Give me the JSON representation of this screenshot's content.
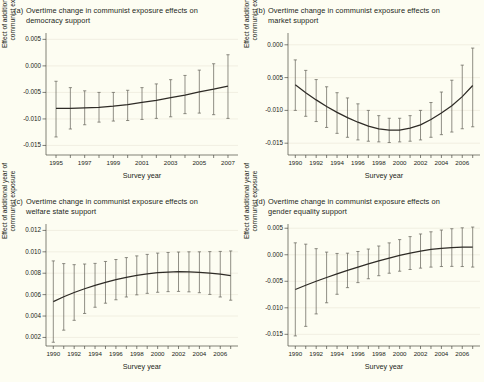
{
  "figure": {
    "background_color": "#fdfdf2",
    "line_color": "#2e2b26",
    "errorbar_color": "#6b6a60",
    "grid_color": "#eceadb",
    "axis_color": "#4a4a44",
    "layout": "2x2 grid of panels"
  },
  "shared": {
    "xlabel": "Survey year",
    "ylabel_line1": "Effect of additional year of",
    "ylabel_line2": "communist exposure"
  },
  "chart_data": [
    {
      "type": "line",
      "panel": "a",
      "tag": "(a)",
      "title": "Overtime change in communist exposure effects on democracy support",
      "title_line1": "Overtime change in communist exposure effects on",
      "title_line2": "democracy support",
      "xlabel": "Survey year",
      "ylabel": "Effect of additional year of communist exposure",
      "xlim": [
        1994.3,
        2007.7
      ],
      "ylim": [
        -0.0168,
        0.0062
      ],
      "yticks": [
        0.005,
        0.0,
        -0.005,
        -0.01,
        -0.015
      ],
      "ytick_labels": [
        "0.005",
        "0.000",
        "-0.005",
        "-0.010",
        "-0.015"
      ],
      "xticks": [
        1995,
        1997,
        1999,
        2001,
        2003,
        2005,
        2007
      ],
      "xtick_labels": [
        "1995",
        "1997",
        "1999",
        "2001",
        "2003",
        "2005",
        "2007"
      ],
      "x_minor_ticks": [
        1995,
        1996,
        1997,
        1998,
        1999,
        2000,
        2001,
        2002,
        2003,
        2004,
        2005,
        2006,
        2007
      ],
      "grid": true,
      "x": [
        1995,
        1996,
        1997,
        1998,
        1999,
        2000,
        2001,
        2002,
        2003,
        2004,
        2005,
        2006,
        2007
      ],
      "values": [
        -0.008,
        -0.008,
        -0.0079,
        -0.0078,
        -0.0076,
        -0.0073,
        -0.0069,
        -0.0065,
        -0.006,
        -0.0055,
        -0.0049,
        -0.0044,
        -0.0038
      ],
      "ci_low": [
        -0.0134,
        -0.0119,
        -0.0111,
        -0.0106,
        -0.0104,
        -0.0103,
        -0.0101,
        -0.0099,
        -0.0096,
        -0.009,
        -0.0089,
        -0.0092,
        -0.0099
      ],
      "ci_high": [
        -0.0029,
        -0.0041,
        -0.0047,
        -0.005,
        -0.005,
        -0.0046,
        -0.0041,
        -0.0034,
        -0.0026,
        -0.0018,
        -0.0008,
        0.0004,
        0.0021
      ]
    },
    {
      "type": "line",
      "panel": "b",
      "tag": "(b)",
      "title": "Overtime change in communist exposure effects on market support",
      "title_line1": "Overtime change in communist exposure effects on",
      "title_line2": "market support",
      "xlabel": "Survey year",
      "ylabel": "Effect of additional year of communist exposure",
      "xlim": [
        1989.3,
        2007.7
      ],
      "ylim": [
        -0.0168,
        0.0018
      ],
      "yticks": [
        0.0,
        -0.005,
        -0.01,
        -0.015
      ],
      "ytick_labels": [
        "0.000",
        "0.005",
        "-0.010",
        "-0.015"
      ],
      "xticks": [
        1990,
        1992,
        1994,
        1996,
        1998,
        2000,
        2002,
        2004,
        2006
      ],
      "xtick_labels": [
        "1990",
        "1992",
        "1994",
        "1996",
        "1998",
        "2000",
        "2002",
        "2004",
        "2006"
      ],
      "x_minor_ticks": [
        1990,
        1991,
        1992,
        1993,
        1994,
        1995,
        1996,
        1997,
        1998,
        1999,
        2000,
        2001,
        2002,
        2003,
        2004,
        2005,
        2006,
        2007
      ],
      "grid": true,
      "x": [
        1990,
        1991,
        1992,
        1993,
        1994,
        1995,
        1996,
        1997,
        1998,
        1999,
        2000,
        2001,
        2002,
        2003,
        2004,
        2005,
        2006,
        2007
      ],
      "values": [
        -0.0061,
        -0.0073,
        -0.0084,
        -0.0094,
        -0.0103,
        -0.0111,
        -0.0118,
        -0.0124,
        -0.0128,
        -0.013,
        -0.013,
        -0.0127,
        -0.0122,
        -0.0114,
        -0.0104,
        -0.0093,
        -0.0079,
        -0.0062
      ],
      "ci_low": [
        -0.01,
        -0.0109,
        -0.0117,
        -0.0126,
        -0.0135,
        -0.0141,
        -0.0145,
        -0.0147,
        -0.0148,
        -0.0149,
        -0.0148,
        -0.0147,
        -0.0145,
        -0.0141,
        -0.0137,
        -0.0133,
        -0.0128,
        -0.0125
      ],
      "ci_high": [
        -0.0023,
        -0.0039,
        -0.0053,
        -0.0064,
        -0.0073,
        -0.0081,
        -0.009,
        -0.01,
        -0.0108,
        -0.0112,
        -0.0112,
        -0.0108,
        -0.01,
        -0.0088,
        -0.0072,
        -0.0054,
        -0.0031,
        -0.0005
      ]
    },
    {
      "type": "line",
      "panel": "c",
      "tag": "(c)",
      "title": "Overtime change in communist exposure effects on welfare state support",
      "title_line1": "Overtime change in communist exposure effects on",
      "title_line2": "welfare state support",
      "xlabel": "Survey year",
      "ylabel": "Effect of additional year of communist exposure",
      "xlim": [
        1989.3,
        2007.7
      ],
      "ylim": [
        0.0012,
        0.0126
      ],
      "yticks": [
        0.012,
        0.01,
        0.008,
        0.006,
        0.004,
        0.002
      ],
      "ytick_labels": [
        "0.012",
        "0.010",
        "0.008",
        "0.006",
        "0.004",
        "0.002"
      ],
      "xticks": [
        1990,
        1992,
        1994,
        1996,
        1998,
        2000,
        2002,
        2004,
        2006
      ],
      "xtick_labels": [
        "1990",
        "1992",
        "1994",
        "1996",
        "1998",
        "2000",
        "2002",
        "2004",
        "2006"
      ],
      "x_minor_ticks": [
        1990,
        1991,
        1992,
        1993,
        1994,
        1995,
        1996,
        1997,
        1998,
        1999,
        2000,
        2001,
        2002,
        2003,
        2004,
        2005,
        2006,
        2007
      ],
      "grid": true,
      "x": [
        1990,
        1991,
        1992,
        1993,
        1994,
        1995,
        1996,
        1997,
        1998,
        1999,
        2000,
        2001,
        2002,
        2003,
        2004,
        2005,
        2006,
        2007
      ],
      "values": [
        0.00535,
        0.0058,
        0.0062,
        0.00655,
        0.00687,
        0.00715,
        0.0074,
        0.00762,
        0.0078,
        0.00794,
        0.00805,
        0.00811,
        0.00814,
        0.00813,
        0.00809,
        0.00802,
        0.00791,
        0.00778
      ],
      "ci_low": [
        0.00155,
        0.00268,
        0.0036,
        0.00424,
        0.00482,
        0.0052,
        0.00552,
        0.00578,
        0.00598,
        0.00612,
        0.00622,
        0.00628,
        0.0063,
        0.00626,
        0.00618,
        0.00602,
        0.00578,
        0.00548
      ],
      "ci_high": [
        0.00915,
        0.0089,
        0.0088,
        0.00886,
        0.00892,
        0.0091,
        0.00928,
        0.00946,
        0.00962,
        0.00976,
        0.00988,
        0.00994,
        0.00998,
        0.01,
        0.01,
        0.01002,
        0.01004,
        0.01008
      ]
    },
    {
      "type": "line",
      "panel": "d",
      "tag": "(d)",
      "title": "Overtime change in communist exposure effects on gender equality support",
      "title_line1": "Overtime change in communist exposure effects on",
      "title_line2": "gender equality support",
      "xlabel": "Survey year",
      "ylabel": "Effect of additional year of communist exposure",
      "xlim": [
        1989.3,
        2007.7
      ],
      "ylim": [
        -0.0172,
        0.0058
      ],
      "yticks": [
        0.005,
        0.0,
        -0.005,
        -0.01,
        -0.015
      ],
      "ytick_labels": [
        "0.005",
        "0.000",
        "-0.005",
        "-0.010",
        "-0.015"
      ],
      "xticks": [
        1990,
        1992,
        1994,
        1996,
        1998,
        2000,
        2002,
        2004,
        2006
      ],
      "xtick_labels": [
        "1990",
        "1992",
        "1994",
        "1996",
        "1998",
        "2000",
        "2002",
        "2004",
        "2006"
      ],
      "x_minor_ticks": [
        1990,
        1991,
        1992,
        1993,
        1994,
        1995,
        1996,
        1997,
        1998,
        1999,
        2000,
        2001,
        2002,
        2003,
        2004,
        2005,
        2006,
        2007
      ],
      "grid": true,
      "x": [
        1990,
        1991,
        1992,
        1993,
        1994,
        1995,
        1996,
        1997,
        1998,
        1999,
        2000,
        2001,
        2002,
        2003,
        2004,
        2005,
        2006,
        2007
      ],
      "values": [
        -0.00655,
        -0.00575,
        -0.005,
        -0.00428,
        -0.0036,
        -0.00295,
        -0.00232,
        -0.00172,
        -0.00115,
        -0.00062,
        -0.00012,
        0.00032,
        0.0007,
        0.001,
        0.00122,
        0.00136,
        0.00143,
        0.00145
      ],
      "ci_low": [
        -0.0153,
        -0.0135,
        -0.01115,
        -0.00905,
        -0.00745,
        -0.0062,
        -0.00525,
        -0.00452,
        -0.00395,
        -0.00348,
        -0.0031,
        -0.00278,
        -0.00252,
        -0.00233,
        -0.00222,
        -0.00219,
        -0.00222,
        -0.00232
      ],
      "ci_high": [
        0.00225,
        0.002,
        0.00115,
        0.0005,
        0.00025,
        0.0003,
        0.00062,
        0.00108,
        0.00165,
        0.00224,
        0.00286,
        0.00342,
        0.00392,
        0.00433,
        0.00466,
        0.00491,
        0.00508,
        0.00522
      ]
    }
  ]
}
